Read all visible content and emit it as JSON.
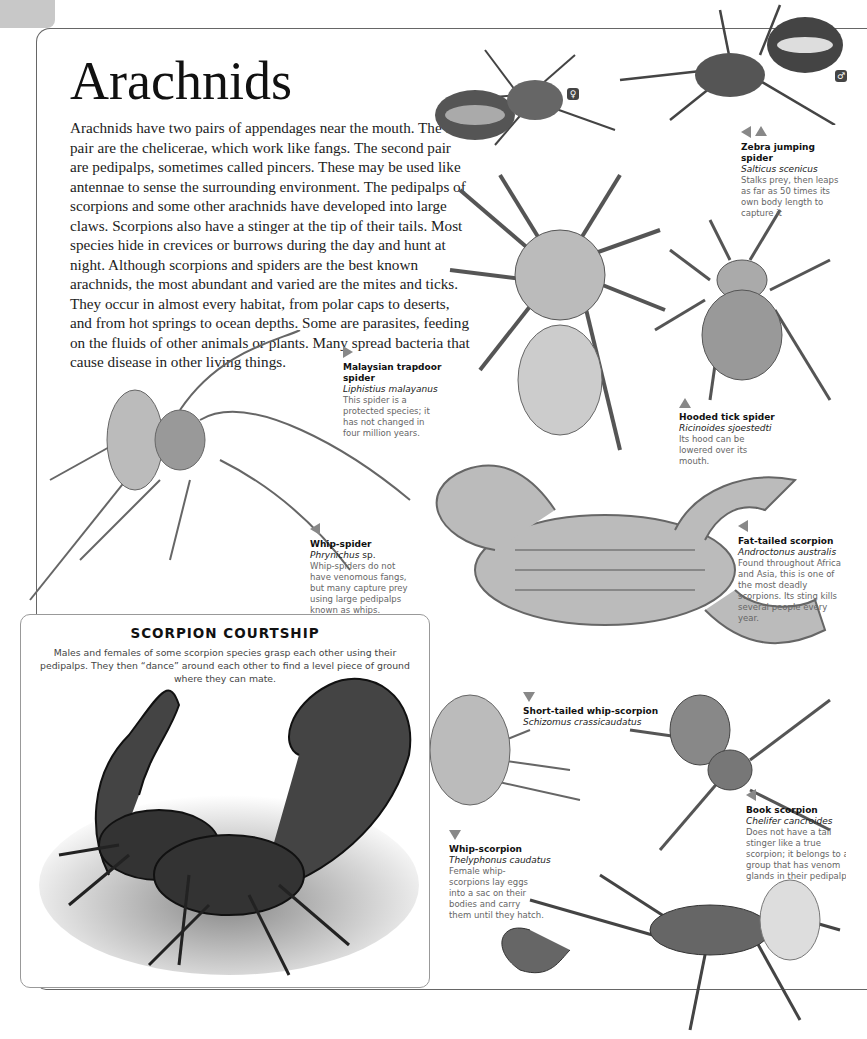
{
  "page": {
    "number_tab": "",
    "title": "Arachnids",
    "intro": "Arachnids have two pairs of appendages near the mouth. The first pair are the chelicerae, which work like fangs. The second pair are pedipalps, sometimes called pincers. These may be used like antennae to sense the surrounding environment. The pedipalps of scorpions and some other arachnids have developed into large claws. Scorpions also have a stinger at the tip of their tails. Most species hide in crevices or burrows during the day and hunt at night. Although scorpions and spiders are the best known arachnids, the most abundant and varied are the mites and ticks. They occur in almost every habitat, from polar caps to deserts, and from hot springs to ocean depths. Some are parasites, feeding on the fluids of other animals or plants. Many spread bacteria that cause disease in other living things."
  },
  "sex_markers": {
    "female": "♀",
    "male": "♂"
  },
  "captions": [
    {
      "id": "zebra",
      "arrows": [
        "left",
        "up"
      ],
      "name": "Zebra jumping spider",
      "scientific": "Salticus scenicus",
      "description": "Stalks prey, then leaps as far as 50 times its own body length to capture it"
    },
    {
      "id": "trapdoor",
      "arrows": [
        "right"
      ],
      "name": "Malaysian trapdoor spider",
      "scientific": "Liphistius malayanus",
      "description": "This spider is a protected species; it has not changed in four million years."
    },
    {
      "id": "tick",
      "arrows": [
        "up"
      ],
      "name": "Hooded tick spider",
      "scientific": "Ricinoides sjoestedti",
      "description": "Its hood can be lowered over its mouth."
    },
    {
      "id": "whipspider",
      "arrows": [
        "left"
      ],
      "name": "Whip-spider",
      "scientific": "Phrynichus",
      "scientific_suffix": " sp.",
      "description": "Whip-spiders do not have venomous fangs, but many capture prey using large pedipalps known as whips."
    },
    {
      "id": "fattailed",
      "arrows": [
        "left"
      ],
      "name": "Fat-tailed scorpion",
      "scientific": "Androctonus australis",
      "description": "Found throughout Africa and Asia, this is one of the most deadly scorpions. Its sting kills several people every year."
    },
    {
      "id": "shorttailed",
      "arrows": [
        "down"
      ],
      "name": "Short-tailed whip-scorpion",
      "scientific": "Schizomus crassicaudatus",
      "description": ""
    },
    {
      "id": "book",
      "arrows": [
        "left"
      ],
      "name": "Book scorpion",
      "scientific": "Chelifer cancroides",
      "description": "Does not have a tail stinger like a true scorpion; it belongs to a group that has venom glands in their pedipalps."
    },
    {
      "id": "whipscorpion",
      "arrows": [
        "down"
      ],
      "name": "Whip-scorpion",
      "scientific": "Thelyphonus caudatus",
      "description": "Female whip-scorpions lay eggs into a sac on their bodies and carry them until they hatch."
    }
  ],
  "feature_box": {
    "heading": "SCORPION COURTSHIP",
    "text": "Males and females of some scorpion species grasp each other using their pedipalps. They then “dance” around each other to find a level piece of ground where they can mate."
  },
  "colors": {
    "arrow": "#888888",
    "frame": "#666666",
    "tab": "#c8c8c8",
    "illustration": "#555555"
  }
}
